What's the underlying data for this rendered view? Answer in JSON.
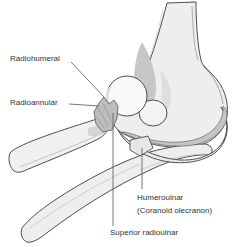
{
  "figure": {
    "labels": {
      "radiohumeral": "Radiohumeral",
      "radioannular": "Radioannular",
      "humeroulnar_line1": "Humeroulnar",
      "humeroulnar_line2": "(Coranoid olecranon)",
      "superior_radioulnar": "Superior radioulnar"
    },
    "palette": {
      "background": "#ffffff",
      "bone_fill": "#eeeeee",
      "bone_highlight": "#f8f8f8",
      "shading_dark": "#c7c7c7",
      "shading_mid": "#dcdcdc",
      "ligament_fill": "#bdbdbd",
      "outline": "#4d4d4d",
      "label_text": "#333333",
      "leader_line": "#666666"
    }
  }
}
